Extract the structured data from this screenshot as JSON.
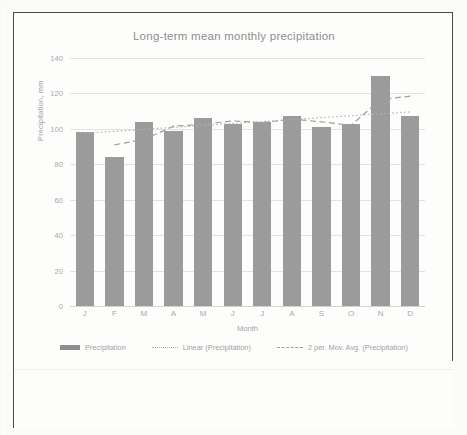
{
  "chart": {
    "title": "Long-term mean monthly precipitation",
    "xlabel": "Month",
    "ylabel": "Precipitation, mm"
  },
  "legend": {
    "items": [
      {
        "label": "Precipitation",
        "marker": "solid-bar-swatch"
      },
      {
        "label": "Linear (Precipitation)",
        "marker": "dotted-line-swatch"
      },
      {
        "label": "2 per. Mov. Avg. (Precipitation)",
        "marker": "dashed-line-swatch"
      }
    ]
  },
  "chart_data": {
    "type": "bar",
    "title": "Long-term mean monthly precipitation",
    "xlabel": "Month",
    "ylabel": "Precipitation, mm",
    "categories": [
      "J",
      "F",
      "M",
      "A",
      "M",
      "J",
      "J",
      "A",
      "S",
      "O",
      "N",
      "D"
    ],
    "category_names": [
      "January",
      "February",
      "March",
      "April",
      "May",
      "June",
      "July",
      "August",
      "September",
      "October",
      "November",
      "December"
    ],
    "values": [
      98,
      84,
      104,
      99,
      106,
      103,
      104,
      107,
      101,
      103,
      130,
      107
    ],
    "ylim": [
      0,
      140
    ],
    "yticks": [
      0,
      20,
      40,
      60,
      80,
      100,
      120,
      140
    ],
    "ytick_labels": [
      "0",
      "20",
      "40",
      "60",
      "80",
      "100",
      "120",
      "140"
    ],
    "grid": true,
    "legend_position": "bottom",
    "bar_color": "#9b9b9b",
    "series": [
      {
        "name": "Precipitation",
        "type": "bar",
        "values": [
          98,
          84,
          104,
          99,
          106,
          103,
          104,
          107,
          101,
          103,
          130,
          107
        ]
      },
      {
        "name": "Linear (Precipitation)",
        "type": "line",
        "style": "dotted",
        "values": [
          97.5,
          98.6,
          99.7,
          100.8,
          101.9,
          103.0,
          104.1,
          105.2,
          106.3,
          107.4,
          108.5,
          109.6
        ]
      },
      {
        "name": "2 per. Mov. Avg. (Precipitation)",
        "type": "line",
        "style": "dashed",
        "values": [
          null,
          91,
          94,
          101.5,
          102.5,
          104.5,
          103.5,
          105.5,
          104,
          102,
          116.5,
          118.5
        ]
      }
    ]
  }
}
